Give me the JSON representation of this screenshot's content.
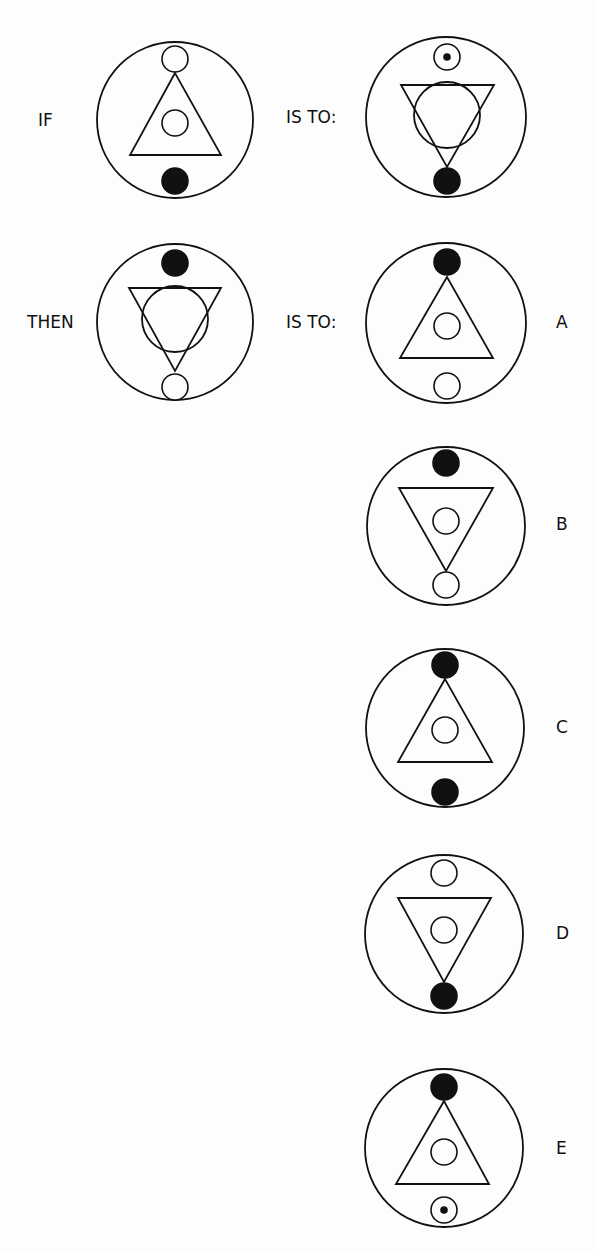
{
  "puzzle": {
    "type": "visual-analogy",
    "rows": [
      {
        "left_label": "IF",
        "mid_label": "IS TO:"
      },
      {
        "left_label": "THEN",
        "mid_label": "IS TO:"
      }
    ],
    "options": [
      {
        "letter": "A"
      },
      {
        "letter": "B"
      },
      {
        "letter": "C"
      },
      {
        "letter": "D"
      },
      {
        "letter": "E"
      }
    ]
  },
  "figures": [
    {
      "id": "if-figure",
      "cx": 175,
      "cy": 120,
      "r": 78,
      "triangle": "up",
      "inner_circle": "small",
      "top_marker": "open",
      "bottom_marker": "filled"
    },
    {
      "id": "is-to-figure-1",
      "cx": 446,
      "cy": 117,
      "r": 80,
      "triangle": "down",
      "inner_circle": "large",
      "top_marker": "dotted",
      "bottom_marker": "filled"
    },
    {
      "id": "then-figure",
      "cx": 175,
      "cy": 322,
      "r": 78,
      "triangle": "down",
      "inner_circle": "large",
      "top_marker": "filled",
      "bottom_marker": "open"
    },
    {
      "id": "option-a-figure",
      "cx": 446,
      "cy": 323,
      "r": 80,
      "triangle": "up",
      "inner_circle": "small",
      "top_marker": "filled",
      "bottom_marker": "open"
    },
    {
      "id": "option-b-figure",
      "cx": 446,
      "cy": 526,
      "r": 79,
      "triangle": "down",
      "inner_circle": "small",
      "top_marker": "filled",
      "bottom_marker": "open"
    },
    {
      "id": "option-c-figure",
      "cx": 445,
      "cy": 728,
      "r": 79,
      "triangle": "up",
      "inner_circle": "small",
      "top_marker": "filled",
      "bottom_marker": "filled"
    },
    {
      "id": "option-d-figure",
      "cx": 444,
      "cy": 934,
      "r": 79,
      "triangle": "down",
      "inner_circle": "small",
      "top_marker": "open",
      "bottom_marker": "filled"
    },
    {
      "id": "option-e-figure",
      "cx": 444,
      "cy": 1148,
      "r": 79,
      "triangle": "up",
      "inner_circle": "small",
      "top_marker": "filled",
      "bottom_marker": "dotted"
    }
  ],
  "colors": {
    "ink": "#111111",
    "paper": "#fdfdfd"
  }
}
